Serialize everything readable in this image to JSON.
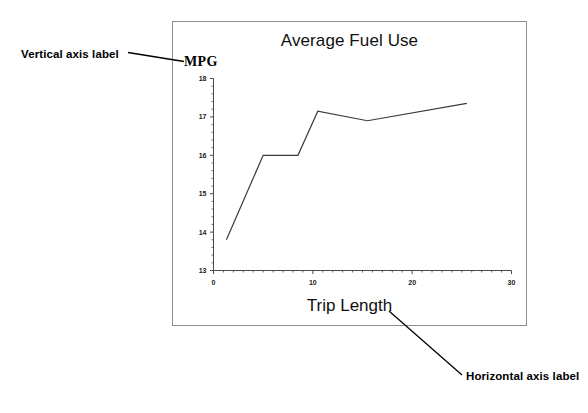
{
  "figure": {
    "background_color": "#ffffff",
    "frame_color": "#8d8d8d"
  },
  "chart": {
    "title": "Average Fuel Use",
    "y_axis_title": "MPG",
    "x_axis_title": "Trip Length",
    "line_color": "#3a3a3a"
  },
  "annotations": {
    "vertical": {
      "label": "Vertical axis label",
      "leader": "leader-line-horizontal"
    },
    "horizontal": {
      "label": "Horizontal axis label",
      "leader": "leader-line-diagonal"
    }
  },
  "chart_data": {
    "type": "line",
    "title": "Average Fuel Use",
    "xlabel": "Trip Length",
    "ylabel": "MPG",
    "xlim": [
      0,
      30
    ],
    "ylim": [
      13,
      18
    ],
    "grid": false,
    "legend": null,
    "x_ticks": [
      0,
      10,
      20,
      30
    ],
    "x_tick_labels": [
      "0",
      "10",
      "20",
      "30"
    ],
    "x_minor_tick_step": 1,
    "y_ticks": [
      13,
      14,
      15,
      16,
      17,
      18
    ],
    "y_tick_labels": [
      "13",
      "14",
      "15",
      "16",
      "17",
      "18"
    ],
    "y_minor_tick_step": 0.2,
    "series": [
      {
        "name": "Average Fuel Use",
        "x": [
          1.3,
          5.0,
          8.5,
          10.5,
          15.5,
          25.5
        ],
        "values": [
          13.8,
          16.0,
          16.0,
          17.15,
          16.9,
          17.35
        ]
      }
    ]
  }
}
